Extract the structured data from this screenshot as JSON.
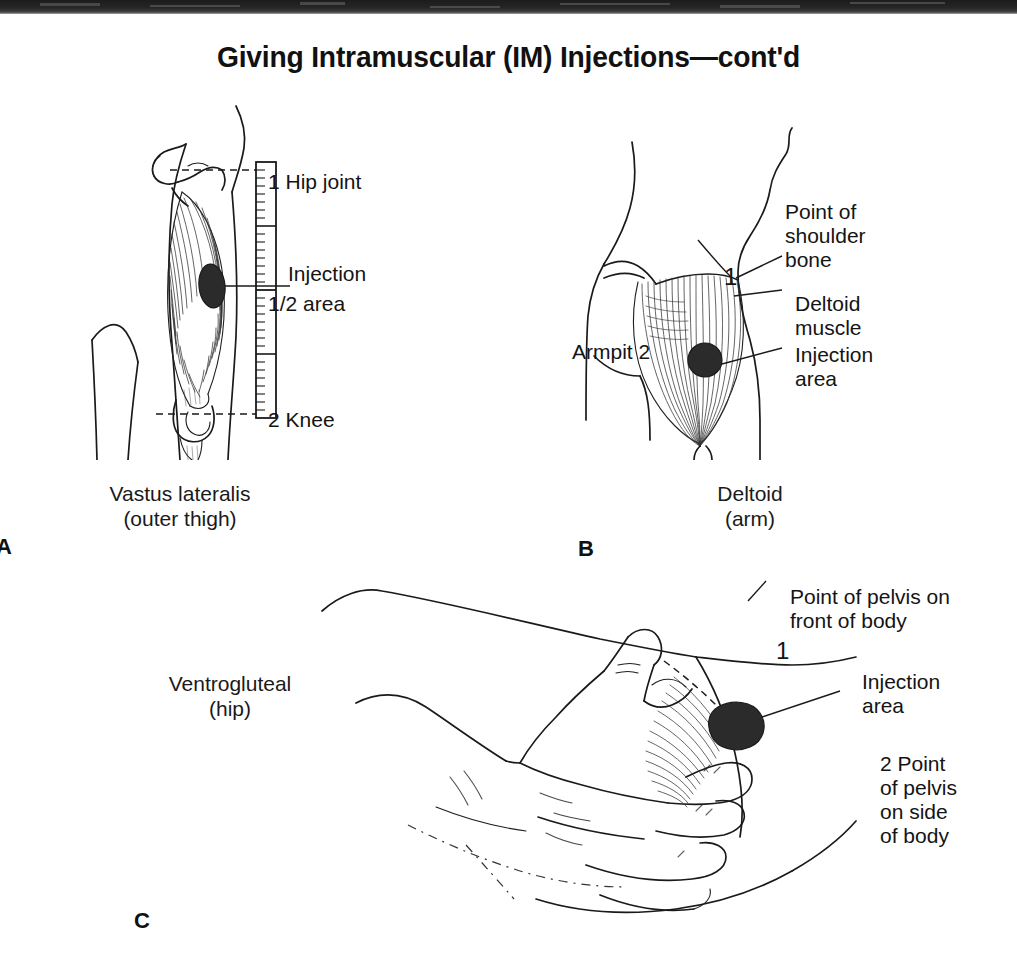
{
  "page": {
    "title": "Giving Intramuscular (IM) Injections—cont'd",
    "background_color": "#ffffff",
    "ink_color": "#1a1a1a",
    "scan_band_color": "#222222"
  },
  "panels": [
    {
      "letter": "A",
      "caption": "Vastus lateralis\n(outer thigh)",
      "caption_line1": "Vastus lateralis",
      "caption_line2": "(outer thigh)",
      "labels": [
        {
          "name": "hip-joint",
          "text": "1 Hip joint"
        },
        {
          "name": "injection-area",
          "text": "Injection"
        },
        {
          "name": "half-mark",
          "text": "1/2   area"
        },
        {
          "name": "knee",
          "text": "2 Knee"
        }
      ],
      "scale_marks": [
        "1",
        "1/2",
        "2"
      ]
    },
    {
      "letter": "B",
      "caption": "Deltoid\n(arm)",
      "caption_line1": "Deltoid",
      "caption_line2": "(arm)",
      "labels": [
        {
          "name": "point-of-shoulder-bone",
          "text": "Point of\nshoulder\nbone"
        },
        {
          "name": "deltoid-muscle",
          "text": "Deltoid\nmuscle"
        },
        {
          "name": "injection-area",
          "text": "Injection\narea"
        },
        {
          "name": "armpit",
          "text": "Armpit 2"
        },
        {
          "name": "landmark-one",
          "text": "1"
        }
      ]
    },
    {
      "letter": "C",
      "caption": "Ventrogluteal\n(hip)",
      "caption_line1": "Ventrogluteal",
      "caption_line2": "(hip)",
      "labels": [
        {
          "name": "point-of-pelvis-front",
          "text": "Point of pelvis on\nfront of body"
        },
        {
          "name": "injection-area",
          "text": "Injection\narea"
        },
        {
          "name": "point-of-pelvis-side",
          "text": "2 Point\nof pelvis\non side\nof body"
        },
        {
          "name": "landmark-one",
          "text": "1"
        }
      ]
    }
  ],
  "bottom_caption": "Fig. 1"
}
